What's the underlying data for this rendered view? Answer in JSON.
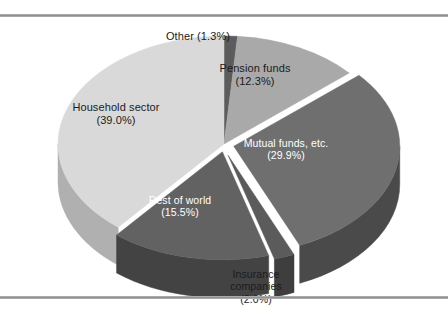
{
  "figure": {
    "background_color": "#ffffff",
    "rule_color": "#8e8e8e",
    "has_top_rule": true,
    "has_bottom_rule": true
  },
  "chart_data": {
    "type": "pie",
    "title": "",
    "subtitle": "",
    "xlabel": "",
    "ylabel": "",
    "legend_position": "none",
    "grid": false,
    "three_d": true,
    "start_angle_deg": -90,
    "direction": "clockwise",
    "categories": [
      "Other",
      "Pension funds",
      "Mutual funds, etc.",
      "Insurance companies",
      "Rest of world",
      "Household sector"
    ],
    "values": [
      1.3,
      12.3,
      29.9,
      2.0,
      15.5,
      39.0
    ],
    "value_unit": "%",
    "slices": [
      {
        "name": "Other",
        "value": 1.3,
        "label_line1": "Other (1.3%)",
        "label_line2": "",
        "label_line3": "",
        "color": "#5c5c5c",
        "side_color": "#3c3c3c",
        "text_color": "#1b1b1b"
      },
      {
        "name": "Pension funds",
        "value": 12.3,
        "label_line1": "Pension funds",
        "label_line2": "(12.3%)",
        "label_line3": "",
        "color": "#a9a9a9",
        "side_color": "#7d7d7d",
        "text_color": "#1b1b1b"
      },
      {
        "name": "Mutual funds, etc.",
        "value": 29.9,
        "label_line1": "Mutual funds, etc.",
        "label_line2": "(29.9%)",
        "label_line3": "",
        "color": "#6f6f6f",
        "side_color": "#4a4a4a",
        "text_color": "#ffffff"
      },
      {
        "name": "Insurance companies",
        "value": 2.0,
        "label_line1": "Insurance",
        "label_line2": "companies",
        "label_line3": "(2.0%)",
        "color": "#5b5b5b",
        "side_color": "#3e3e3e",
        "text_color": "#1b1b1b"
      },
      {
        "name": "Rest of world",
        "value": 15.5,
        "label_line1": "Rest of world",
        "label_line2": "(15.5%)",
        "label_line3": "",
        "color": "#626262",
        "side_color": "#434343",
        "text_color": "#ffffff"
      },
      {
        "name": "Household sector",
        "value": 39.0,
        "label_line1": "Household sector",
        "label_line2": "(39.0%)",
        "label_line3": "",
        "color": "#d9d9d9",
        "side_color": "#b0b0b0",
        "text_color": "#1b1b1b"
      }
    ]
  },
  "footnote": {
    "text": "·  ···  ··  ··  ···  ··  ···  ··  ····  ··  ···  ··  ···  ··"
  }
}
